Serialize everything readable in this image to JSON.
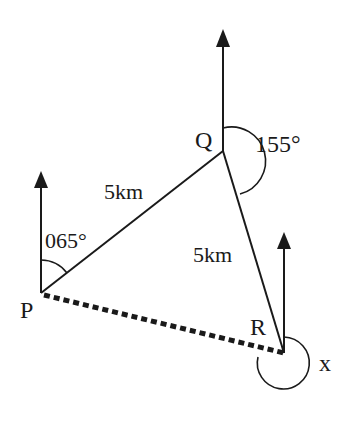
{
  "diagram": {
    "type": "bearing-diagram",
    "points": {
      "P": {
        "label": "P",
        "x": 41,
        "y": 293
      },
      "Q": {
        "label": "Q",
        "x": 223,
        "y": 151
      },
      "R": {
        "label": "R",
        "x": 284,
        "y": 353
      }
    },
    "north_arrows": [
      {
        "at": "P",
        "tip_y": 172
      },
      {
        "at": "Q",
        "tip_y": 30
      },
      {
        "at": "R",
        "tip_y": 232
      }
    ],
    "edges": [
      {
        "from": "P",
        "to": "Q",
        "label": "5km",
        "style": "solid"
      },
      {
        "from": "Q",
        "to": "R",
        "label": "5km",
        "style": "solid"
      },
      {
        "from": "P",
        "to": "R",
        "label": "",
        "style": "dashed"
      }
    ],
    "angles": {
      "P": "065°",
      "Q": "155°",
      "R": "x"
    },
    "colors": {
      "ink": "#1a1a1a",
      "background": "#ffffff"
    }
  }
}
